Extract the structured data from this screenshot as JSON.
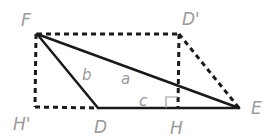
{
  "diagram": {
    "points": {
      "F": {
        "label": "F",
        "x": 37,
        "y": 34
      },
      "D_prime": {
        "label": "D'",
        "x": 179,
        "y": 34
      },
      "H_prime": {
        "label": "H'",
        "x": 35,
        "y": 107
      },
      "D": {
        "label": "D",
        "x": 98,
        "y": 108
      },
      "H": {
        "label": "H",
        "x": 178,
        "y": 108
      },
      "E": {
        "label": "E",
        "x": 239,
        "y": 108
      }
    },
    "sides": {
      "a": "a",
      "b": "b",
      "c": "c"
    },
    "colors": {
      "solid_line": "#1a1a1a",
      "dashed_line": "#1a1a1a",
      "label": "#9a9a9a",
      "background": "#ffffff"
    }
  }
}
